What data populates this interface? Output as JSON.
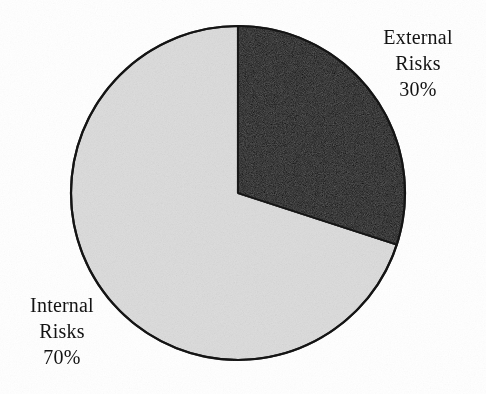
{
  "figure": {
    "background_color": "#ffffff",
    "outline_color": "#121212"
  },
  "chart_data": {
    "type": "pie",
    "title": "",
    "subtitle": "",
    "xlabel": "",
    "ylabel": "",
    "grid": false,
    "legend_position": "none",
    "label_placement": "outside-callout-free",
    "start_angle_deg": 0,
    "direction": "clockwise",
    "units": "percent",
    "total": 100,
    "categories": [
      "External Risks",
      "Internal Risks"
    ],
    "values": [
      30,
      70
    ],
    "slices": [
      {
        "name": "External Risks",
        "label_line1": "External",
        "label_line2": "Risks",
        "value": 30,
        "value_label": "30%",
        "color": "#0b0b0b",
        "start_angle_deg": 0,
        "end_angle_deg": 108,
        "label_side": "right"
      },
      {
        "name": "Internal Risks",
        "label_line1": "Internal",
        "label_line2": "Risks",
        "value": 70,
        "value_label": "70%",
        "color": "#dedede",
        "start_angle_deg": 108,
        "end_angle_deg": 360,
        "label_side": "left"
      }
    ],
    "annotations": []
  },
  "labels": {
    "external": {
      "line1": "External",
      "line2": "Risks",
      "line3": "30%"
    },
    "internal": {
      "line1": "Internal",
      "line2": "Risks",
      "line3": "70%"
    }
  }
}
